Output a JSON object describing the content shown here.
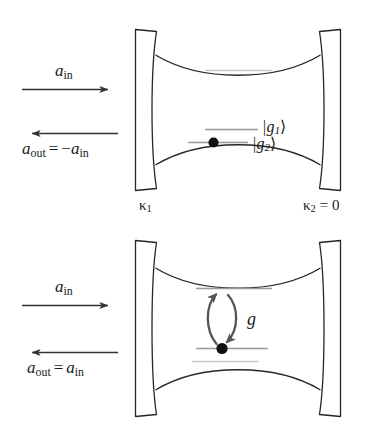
{
  "figure": {
    "type": "physics-schematic",
    "stroke_color": "#262626",
    "level_color": "#8c8c8c",
    "level_color_faint": "#c8c8c8",
    "dot_color": "#111111",
    "arrow_color": "#333333",
    "coupling_arrow_color": "#555555"
  },
  "panels": [
    {
      "id": "top",
      "name": "uncoupled-cavity",
      "input_label": "a",
      "input_sub": "in",
      "output_label": "a",
      "output_sub": "out",
      "output_equals": "=",
      "output_sign": "−",
      "output_rhs": "a",
      "output_rhs_sub": "in",
      "left_mirror_label": "κ",
      "left_mirror_sub": "1",
      "right_mirror_label": "κ",
      "right_mirror_sub": "2",
      "right_mirror_value": "= 0",
      "levels": [
        {
          "name": "upper-faint-level",
          "shade": "faint"
        },
        {
          "name": "g1-level",
          "shade": "mid",
          "label": "|g",
          "label_sub": "1",
          "label_end": "⟩"
        },
        {
          "name": "g2-level",
          "shade": "mid",
          "label": "|g",
          "label_sub": "2",
          "label_end": "⟩",
          "has_dot": true
        }
      ]
    },
    {
      "id": "bottom",
      "name": "coupled-cavity",
      "input_label": "a",
      "input_sub": "in",
      "output_label": "a",
      "output_sub": "out",
      "output_equals": "=",
      "output_sign": "",
      "output_rhs": "a",
      "output_rhs_sub": "in",
      "coupling_label": "g",
      "levels": [
        {
          "name": "upper-level",
          "shade": "mid"
        },
        {
          "name": "lower-level",
          "shade": "mid",
          "has_dot": true
        },
        {
          "name": "lowest-faint-level",
          "shade": "faint"
        }
      ]
    }
  ]
}
